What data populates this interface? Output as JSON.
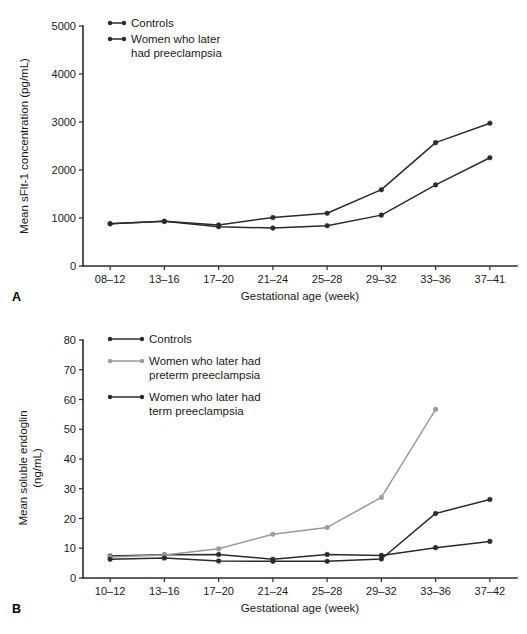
{
  "figure": {
    "background": "#ffffff",
    "ink": "#1a1a1a"
  },
  "panels": [
    {
      "letter": "A",
      "xlabel": "Gestational age (week)",
      "ylabel": "Mean sFlt-1 concentration (pg/mL)"
    },
    {
      "letter": "B",
      "xlabel": "Gestational age (week)",
      "ylabel_line1": "Mean soluble endoglin",
      "ylabel_line2": "(ng/mL)"
    }
  ],
  "chart_data": [
    {
      "type": "line",
      "panel": "A",
      "title": "",
      "xlabel": "Gestational age (week)",
      "ylabel": "Mean sFlt-1 concentration (pg/mL)",
      "categories": [
        "08–12",
        "13–16",
        "17–20",
        "21–24",
        "25–28",
        "29–32",
        "33–36",
        "37–41"
      ],
      "yticks": [
        0,
        1000,
        2000,
        3000,
        4000,
        5000
      ],
      "ytick_labels": [
        "0",
        "1000",
        "2000",
        "3000",
        "4000",
        "5000"
      ],
      "ylim": [
        0,
        5000
      ],
      "grid": false,
      "legend_position": "top-left",
      "series": [
        {
          "name": "Controls",
          "color": "#2b2b2b",
          "marker": "circle",
          "values": [
            880,
            930,
            820,
            790,
            840,
            1060,
            1690,
            2255
          ]
        },
        {
          "name": "Women who later had preeclampsia",
          "legend_lines": [
            "Women who later",
            "had preeclampsia"
          ],
          "color": "#2b2b2b",
          "marker": "circle",
          "values": [
            880,
            930,
            855,
            1010,
            1100,
            1590,
            2570,
            2975
          ]
        }
      ]
    },
    {
      "type": "line",
      "panel": "B",
      "title": "",
      "xlabel": "Gestational age (week)",
      "ylabel": "Mean soluble endoglin (ng/mL)",
      "categories": [
        "10–12",
        "13–16",
        "17–20",
        "21–24",
        "25–28",
        "29–32",
        "33–36",
        "37–42"
      ],
      "yticks": [
        0,
        10,
        20,
        30,
        40,
        50,
        60,
        70,
        80
      ],
      "ytick_labels": [
        "0",
        "10",
        "20",
        "30",
        "40",
        "50",
        "60",
        "70",
        "80"
      ],
      "ylim": [
        0,
        80
      ],
      "grid": false,
      "legend_position": "top-left",
      "series": [
        {
          "name": "Controls",
          "legend_lines": [
            "Controls"
          ],
          "color": "#2b2b2b",
          "marker": "circle",
          "values": [
            7.4,
            7.8,
            7.9,
            6.3,
            7.9,
            7.6,
            10.2,
            12.3
          ]
        },
        {
          "name": "Women who later had preterm preeclampsia",
          "legend_lines": [
            "Women who later had",
            "preterm preeclampsia"
          ],
          "color": "#9a9a9a",
          "marker": "circle",
          "values": [
            7.1,
            7.7,
            9.8,
            14.7,
            17.0,
            27.1,
            56.7,
            null
          ]
        },
        {
          "name": "Women who later had term preeclampsia",
          "legend_lines": [
            "Women who later had",
            "term preeclampsia"
          ],
          "color": "#2b2b2b",
          "marker": "circle",
          "values": [
            6.3,
            6.7,
            5.7,
            5.6,
            5.6,
            6.4,
            21.7,
            26.4
          ]
        }
      ]
    }
  ],
  "caption": {
    "text": " "
  }
}
